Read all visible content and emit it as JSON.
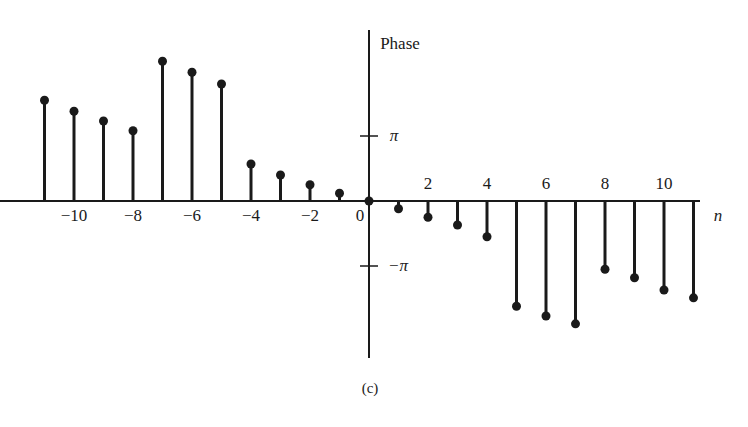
{
  "chart_data": {
    "type": "stem",
    "title": "",
    "ylabel": "Phase",
    "xlabel": "n",
    "caption": "(c)",
    "x": [
      -11,
      -10,
      -9,
      -8,
      -7,
      -6,
      -5,
      -4,
      -3,
      -2,
      -1,
      0,
      1,
      2,
      3,
      4,
      5,
      6,
      7,
      8,
      9,
      10,
      11
    ],
    "values": [
      1.55,
      1.38,
      1.23,
      1.08,
      2.15,
      1.98,
      1.8,
      0.57,
      0.4,
      0.25,
      0.12,
      0,
      -0.12,
      -0.25,
      -0.37,
      -0.55,
      -1.62,
      -1.77,
      -1.89,
      -1.05,
      -1.18,
      -1.37,
      -1.49
    ],
    "value_units": "radians",
    "x_tick_labels": [
      {
        "n": -10,
        "label": "−10"
      },
      {
        "n": -8,
        "label": "−8"
      },
      {
        "n": -6,
        "label": "−6"
      },
      {
        "n": -4,
        "label": "−4"
      },
      {
        "n": -2,
        "label": "−2"
      },
      {
        "n": 0,
        "label": "0"
      },
      {
        "n": 2,
        "label": "2"
      },
      {
        "n": 4,
        "label": "4"
      },
      {
        "n": 6,
        "label": "6"
      },
      {
        "n": 8,
        "label": "8"
      },
      {
        "n": 10,
        "label": "10"
      }
    ],
    "y_tick_labels": [
      {
        "value": 3.14159,
        "label": "π"
      },
      {
        "value": -3.14159,
        "label": "−π"
      }
    ],
    "grid": false,
    "legend": null
  },
  "labels": {
    "phase": "Phase",
    "n": "n",
    "caption": "(c)",
    "pi": "π",
    "neg_pi": "−π"
  }
}
